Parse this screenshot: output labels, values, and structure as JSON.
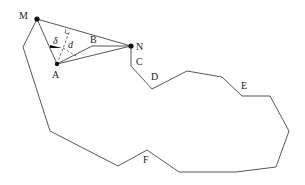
{
  "figure": {
    "labels": {
      "M": "M",
      "N": "N",
      "A": "A",
      "B": "B",
      "C": "C",
      "D": "D",
      "E": "E",
      "F": "F",
      "delta": "δ",
      "d": "d"
    },
    "colors": {
      "stroke": "#444444",
      "point": "#111111",
      "text": "#222222"
    },
    "points": {
      "M": [
        37,
        19
      ],
      "N": [
        131,
        46
      ],
      "A": [
        57,
        64
      ],
      "B": [
        92,
        46
      ]
    },
    "outline": [
      [
        131,
        46
      ],
      [
        131,
        66
      ],
      [
        152,
        89
      ],
      [
        187,
        71
      ],
      [
        222,
        77
      ],
      [
        242,
        96
      ],
      [
        270,
        96
      ],
      [
        289,
        131
      ],
      [
        276,
        167
      ],
      [
        236,
        172
      ],
      [
        179,
        172
      ],
      [
        147,
        150
      ],
      [
        118,
        166
      ],
      [
        50,
        131
      ],
      [
        23,
        47
      ],
      [
        37,
        19
      ]
    ]
  }
}
